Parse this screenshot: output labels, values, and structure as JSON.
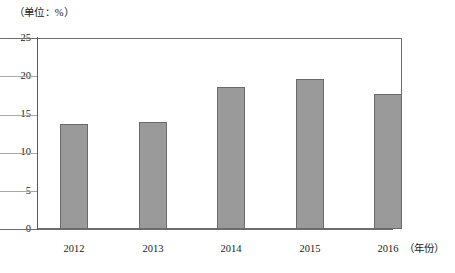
{
  "chart_data": {
    "type": "bar",
    "title": "",
    "unit_caption": "（单位：%）",
    "xlabel": "（年份）",
    "ylabel": "",
    "categories": [
      "2012",
      "2013",
      "2014",
      "2015",
      "2016"
    ],
    "values": [
      13.7,
      14.0,
      18.6,
      19.6,
      17.7
    ],
    "series": [
      {
        "name": "",
        "values": [
          13.7,
          14.0,
          18.6,
          19.6,
          17.7
        ]
      }
    ],
    "ylim": [
      0,
      25
    ],
    "yticks": [
      0,
      5,
      10,
      15,
      20,
      25
    ],
    "ytick_labels": [
      "0",
      "5",
      "10",
      "15",
      "20",
      "25"
    ],
    "grid": true,
    "legend": false,
    "legend_position": "none",
    "bar_color": "#9a9a9a",
    "bar_border_color": "#6a6a6a",
    "gridline_color": "#a8a8a8",
    "axis_color": "#5a5a5a"
  }
}
